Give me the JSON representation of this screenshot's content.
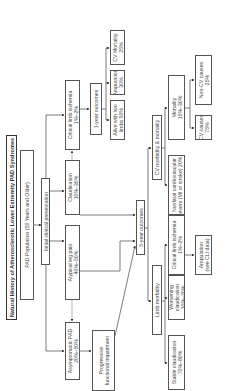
{
  "diagram": {
    "title": "Natural History of Atherosclerotic Lower Extremity PAD Syndromes",
    "population": "PAD Population (50 Years and Older)",
    "initial": "Initial clinical presentation",
    "presentations": [
      {
        "label": "Asymptomatic PAD",
        "pct": "20%–50%"
      },
      {
        "label": "Atypical leg pain",
        "pct": "40%–50%"
      },
      {
        "label": "Claudication",
        "pct": "10%–35%"
      },
      {
        "label": "Critical limb ischemia",
        "pct": "1%–2%"
      }
    ],
    "progressive": {
      "line1": "Progressive",
      "line2": "functional impairment"
    },
    "one_year": {
      "label": "1-year outcomes",
      "alive": {
        "line1": "Alive with two",
        "line2": "limbs 50%"
      },
      "amputation": {
        "line1": "Amputation",
        "line2": "30%"
      },
      "cv_mortality": {
        "line1": "CV Mortality",
        "line2": "25%"
      }
    },
    "five_year": {
      "label": "5-year outcomes",
      "limb_morbidity": "Limb morbidity",
      "cv_morbidity": "CV morbidity & mortality",
      "stable": {
        "line1": "Stable claudication",
        "line2": "70%–80%"
      },
      "worsening": {
        "line1": "Worsening",
        "line2": "claudication",
        "line3": "10%–20%"
      },
      "cli": {
        "line1": "Critical limb ischemia",
        "line2": "1%–2%"
      },
      "amputation": {
        "line1": "Amputation",
        "line2": "(see CLI data)"
      },
      "nonfatal": {
        "line1": "Nonfatal cardiovascular",
        "line2": "event (MI or stroke) 20%"
      },
      "mortality": {
        "line1": "Mortality",
        "line2": "15%–30%"
      },
      "cv_causes": {
        "line1": "CV causes",
        "line2": "75%"
      },
      "noncv_causes": {
        "line1": "Non-CV causes",
        "line2": "25%"
      }
    }
  }
}
